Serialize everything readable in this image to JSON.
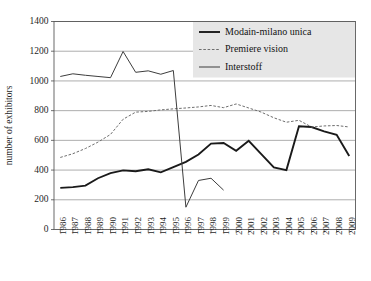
{
  "chart_data": {
    "type": "line",
    "title": "",
    "xlabel": "",
    "ylabel": "number of exhibitors",
    "ylim": [
      0,
      1400
    ],
    "ytick_step": 200,
    "yticks": [
      "0",
      "200",
      "400",
      "600",
      "800",
      "1000",
      "1200",
      "1400"
    ],
    "grid": "horizontal",
    "legend_position": "top-right",
    "categories": [
      "1986",
      "1987",
      "1988",
      "1989",
      "1990",
      "1991",
      "1992",
      "1993",
      "1994",
      "1995",
      "1996",
      "1997",
      "1998",
      "1999",
      "2000",
      "2001",
      "2002",
      "2003",
      "2004",
      "2005",
      "2006",
      "2007",
      "2008",
      "2009"
    ],
    "series": [
      {
        "name": "Modain-milano unica",
        "style": "solid-thick",
        "color": "#1a1a1a",
        "width": 1.9,
        "values": [
          280,
          285,
          295,
          345,
          380,
          398,
          392,
          405,
          385,
          420,
          455,
          505,
          578,
          582,
          530,
          597,
          508,
          418,
          400,
          695,
          690,
          660,
          638,
          495
        ]
      },
      {
        "name": "Premiere vision",
        "style": "dashed",
        "color": "#6e6e6e",
        "width": 1.0,
        "values": [
          485,
          510,
          545,
          588,
          640,
          742,
          790,
          795,
          805,
          812,
          818,
          825,
          835,
          820,
          845,
          818,
          790,
          752,
          722,
          735,
          690,
          697,
          700,
          690
        ]
      },
      {
        "name": "Interstoff",
        "style": "solid-thin",
        "color": "#3d3d3d",
        "width": 1.0,
        "values": [
          1030,
          1048,
          1038,
          1030,
          1022,
          1198,
          1058,
          1068,
          1045,
          1070,
          150,
          330,
          345,
          265,
          null,
          null,
          null,
          null,
          null,
          null,
          null,
          null,
          null,
          null
        ]
      }
    ]
  }
}
